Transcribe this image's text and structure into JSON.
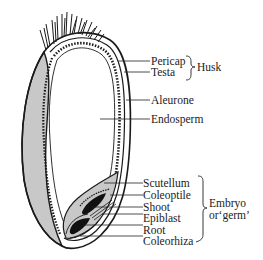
{
  "diagram": {
    "colors": {
      "outline": "#1a1a1a",
      "shaded": "#c8c8c8",
      "embryo_dark": "#111111",
      "background": "#ffffff",
      "text": "#222222"
    },
    "labels": {
      "pericap": "Pericap",
      "testa": "Testa",
      "husk": "Husk",
      "aleurone": "Aleurone",
      "endosperm": "Endosperm",
      "scutellum": "Scutellum",
      "coleoptile": "Coleoptile",
      "shoot": "Shoot",
      "epiblast": "Epiblast",
      "root": "Root",
      "coleorhiza": "Coleorhiza",
      "embryo_line1": "Embryo",
      "embryo_line2": "or‘germ’"
    }
  }
}
